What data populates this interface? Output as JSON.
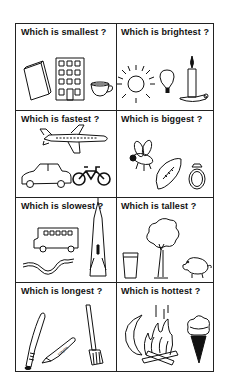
{
  "worksheet": {
    "cells": [
      {
        "question": "Which is smallest ?",
        "items": [
          "book",
          "building",
          "teacup"
        ]
      },
      {
        "question": "Which is brightest ?",
        "items": [
          "sun",
          "light bulb",
          "candle"
        ]
      },
      {
        "question": "Which is fastest ?",
        "items": [
          "airplane",
          "car",
          "bicycle"
        ]
      },
      {
        "question": "Which is biggest ?",
        "items": [
          "bee",
          "football",
          "ring"
        ]
      },
      {
        "question": "Which is slowest ?",
        "items": [
          "bus",
          "snake",
          "rocket"
        ]
      },
      {
        "question": "Which is tallest ?",
        "items": [
          "glass",
          "tree",
          "pig"
        ]
      },
      {
        "question": "Which is longest ?",
        "items": [
          "baseball bat",
          "crayon",
          "broom"
        ]
      },
      {
        "question": "Which is hottest ?",
        "items": [
          "moon",
          "campfire",
          "ice cream cone"
        ]
      }
    ],
    "crayon_label": "crayon"
  },
  "colors": {
    "ink": "#111111",
    "background": "#ffffff"
  }
}
